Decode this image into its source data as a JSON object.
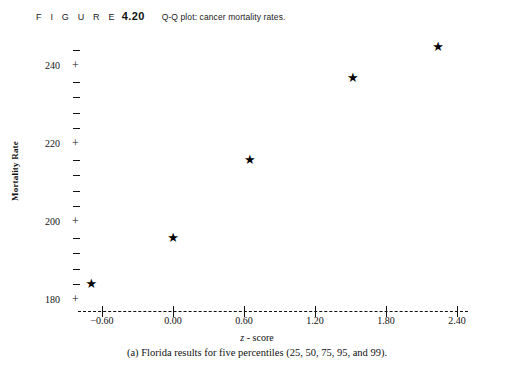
{
  "figure": {
    "label": "F I G U R E",
    "number": "4.20",
    "inline_caption": "Q-Q plot: cancer mortality rates."
  },
  "bottom_caption": "(a) Florida results for five percentiles (25, 50, 75, 95, and 99).",
  "chart_data": {
    "type": "scatter",
    "title": "Q-Q plot: cancer mortality rates.",
    "xlabel": "z - score",
    "ylabel": "Mortality Rate",
    "xlim": [
      -0.9,
      2.7
    ],
    "ylim": [
      176,
      248
    ],
    "grid": false,
    "legend": null,
    "marker": "star",
    "marker_color": "#000000",
    "x_ticks": [
      -0.6,
      0.0,
      0.6,
      1.2,
      1.8,
      2.4
    ],
    "x_tick_labels": [
      "-0.60",
      "0.00",
      "0.60",
      "1.20",
      "1.80",
      "2.40"
    ],
    "y_major_ticks": [
      240,
      220,
      200,
      180
    ],
    "y_major_tick_labels": [
      "240",
      "220",
      "200",
      "180"
    ],
    "y_minor_tick_step": 4,
    "percentiles": [
      25,
      50,
      75,
      95,
      99
    ],
    "points": [
      {
        "percentile": 25,
        "x": -0.69,
        "y": 184
      },
      {
        "percentile": 50,
        "x": 0.0,
        "y": 196
      },
      {
        "percentile": 75,
        "x": 0.65,
        "y": 216
      },
      {
        "percentile": 95,
        "x": 1.52,
        "y": 237
      },
      {
        "percentile": 99,
        "x": 2.24,
        "y": 245
      }
    ],
    "axis_style": {
      "x_axis_line": "dashed",
      "y_axis_line": "none",
      "tick_glyph_major": "+",
      "tick_glyph_minor": "-"
    },
    "colors": {
      "foreground": "#111111",
      "background": "#ffffff"
    }
  },
  "glyphs": {
    "star": "★",
    "plus": "+"
  }
}
